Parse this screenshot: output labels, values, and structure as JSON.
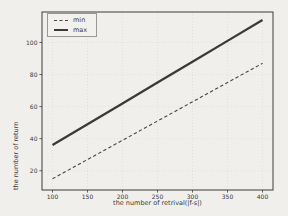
{
  "figure": {
    "background": "#f1efec",
    "text_color": "#3a3a3a",
    "spine_color": "#3d3d3d",
    "grid_color": "#d9d7d3"
  },
  "chart_data": {
    "type": "line",
    "title": "",
    "xlabel": "the number of retrival(|f-s|)",
    "ylabel": "the number of return",
    "x": [
      100,
      150,
      200,
      250,
      300,
      350,
      400
    ],
    "series": [
      {
        "name": "min",
        "style": "dashed",
        "color": "#474747",
        "width": 1.1,
        "values": [
          15,
          27,
          39,
          51,
          63,
          75,
          87
        ]
      },
      {
        "name": "max",
        "style": "solid",
        "color": "#3a3a3a",
        "width": 2.3,
        "values": [
          36,
          49,
          62,
          75,
          88,
          101,
          114
        ]
      }
    ],
    "xticks": [
      100,
      150,
      200,
      250,
      300,
      350,
      400
    ],
    "yticks": [
      20,
      40,
      60,
      80,
      100
    ],
    "xlim": [
      85,
      415
    ],
    "ylim": [
      8,
      119
    ],
    "grid": true,
    "legend_position": "upper-left"
  }
}
